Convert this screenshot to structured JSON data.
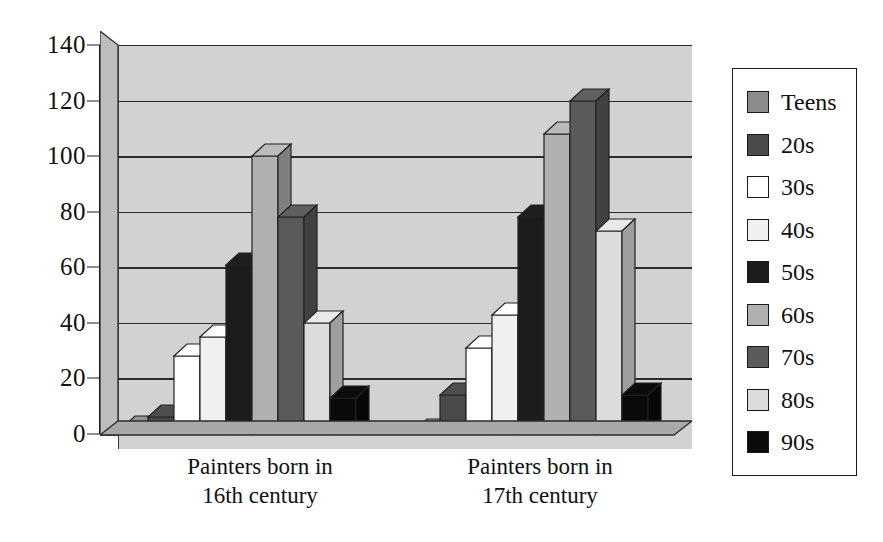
{
  "chart_data": {
    "type": "bar",
    "title": "",
    "subtitle": "",
    "xlabel": "",
    "ylabel": "",
    "ylim": [
      0,
      140
    ],
    "yticks": [
      0,
      20,
      40,
      60,
      80,
      100,
      120,
      140
    ],
    "grid": true,
    "legend_position": "right",
    "style": "3d-clustered-column",
    "categories": [
      "Painters born in 16th century",
      "Painters born in 17th century"
    ],
    "category_lines": [
      [
        "Painters born in",
        "16th century"
      ],
      [
        "Painters born in",
        "17th century"
      ]
    ],
    "series": [
      {
        "name": "Teens",
        "color": "#8c8c8c",
        "values": [
          2,
          1
        ]
      },
      {
        "name": "20s",
        "color": "#4a4a4a",
        "values": [
          6,
          14
        ]
      },
      {
        "name": "30s",
        "color": "#ffffff",
        "values": [
          28,
          31
        ]
      },
      {
        "name": "40s",
        "color": "#f0f0f0",
        "values": [
          35,
          43
        ]
      },
      {
        "name": "50s",
        "color": "#1c1c1c",
        "values": [
          61,
          78
        ]
      },
      {
        "name": "60s",
        "color": "#b0b0b0",
        "values": [
          100,
          108
        ]
      },
      {
        "name": "70s",
        "color": "#5a5a5a",
        "values": [
          78,
          120
        ]
      },
      {
        "name": "80s",
        "color": "#dcdcdc",
        "values": [
          40,
          73
        ]
      },
      {
        "name": "90s",
        "color": "#0a0a0a",
        "values": [
          13,
          14
        ]
      }
    ]
  },
  "legend": {
    "items": [
      {
        "label": "Teens",
        "color": "#8c8c8c"
      },
      {
        "label": "20s",
        "color": "#4a4a4a"
      },
      {
        "label": "30s",
        "color": "#ffffff"
      },
      {
        "label": "40s",
        "color": "#f0f0f0"
      },
      {
        "label": "50s",
        "color": "#1c1c1c"
      },
      {
        "label": "60s",
        "color": "#b0b0b0"
      },
      {
        "label": "70s",
        "color": "#5a5a5a"
      },
      {
        "label": "80s",
        "color": "#dcdcdc"
      },
      {
        "label": "90s",
        "color": "#0a0a0a"
      }
    ]
  },
  "colors": {
    "plot_background": "#d2d2d2",
    "axis": "#1a1a1a",
    "gridline": "#2b2b2b",
    "text": "#111111",
    "page_background": "#ffffff"
  }
}
